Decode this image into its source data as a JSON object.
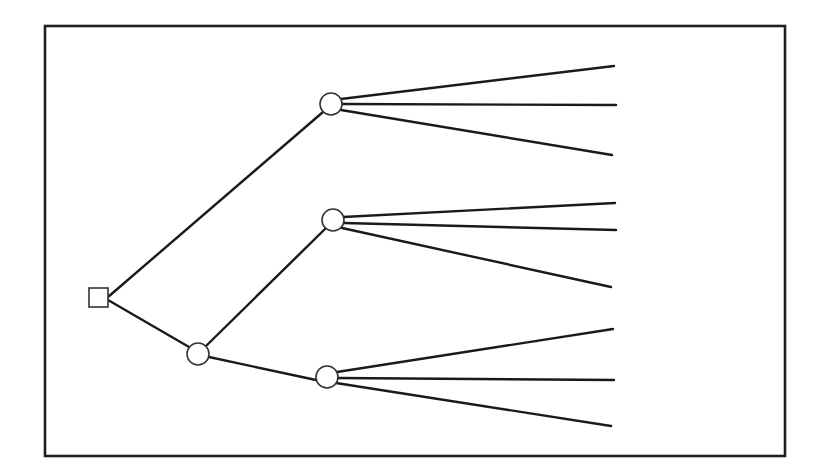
{
  "diagram": {
    "type": "decision-tree",
    "colors": {
      "background": "#ffffff",
      "line": "#1a1a1a",
      "frame": "#1e1e1e",
      "node_fill": "#ffffff",
      "node_stroke": "#333333"
    },
    "frame": {
      "x": 45,
      "y": 26,
      "width": 740,
      "height": 430
    },
    "nodes": [
      {
        "id": "root",
        "kind": "decision",
        "shape": "square",
        "x": 89,
        "y": 288,
        "size": 19
      },
      {
        "id": "c1",
        "kind": "chance",
        "shape": "circle",
        "cx": 198,
        "cy": 354,
        "r": 11
      },
      {
        "id": "c2",
        "kind": "chance",
        "shape": "circle",
        "cx": 331,
        "cy": 104,
        "r": 11
      },
      {
        "id": "c3",
        "kind": "chance",
        "shape": "circle",
        "cx": 333,
        "cy": 220,
        "r": 11
      },
      {
        "id": "c4",
        "kind": "chance",
        "shape": "circle",
        "cx": 327,
        "cy": 377,
        "r": 11
      }
    ],
    "edges": [
      {
        "from": "root",
        "to": "c2",
        "x1": 108,
        "y1": 297,
        "x2": 323,
        "y2": 112
      },
      {
        "from": "root",
        "to": "c1",
        "x1": 108,
        "y1": 300,
        "x2": 189,
        "y2": 347
      },
      {
        "from": "c1",
        "to": "c3",
        "x1": 206,
        "y1": 346,
        "x2": 326,
        "y2": 228
      },
      {
        "from": "c1",
        "to": "c4",
        "x1": 209,
        "y1": 357,
        "x2": 316,
        "y2": 380
      }
    ],
    "outcome_branches": [
      {
        "from": "c2",
        "x1": 341,
        "y1": 99,
        "x2": 614,
        "y2": 66
      },
      {
        "from": "c2",
        "x1": 342,
        "y1": 104,
        "x2": 616,
        "y2": 105
      },
      {
        "from": "c2",
        "x1": 341,
        "y1": 110,
        "x2": 612,
        "y2": 155
      },
      {
        "from": "c3",
        "x1": 343,
        "y1": 217,
        "x2": 615,
        "y2": 203
      },
      {
        "from": "c3",
        "x1": 344,
        "y1": 223,
        "x2": 616,
        "y2": 230
      },
      {
        "from": "c3",
        "x1": 342,
        "y1": 228,
        "x2": 611,
        "y2": 287
      },
      {
        "from": "c4",
        "x1": 337,
        "y1": 372,
        "x2": 613,
        "y2": 329
      },
      {
        "from": "c4",
        "x1": 338,
        "y1": 378,
        "x2": 614,
        "y2": 380
      },
      {
        "from": "c4",
        "x1": 336,
        "y1": 383,
        "x2": 611,
        "y2": 426
      }
    ]
  }
}
